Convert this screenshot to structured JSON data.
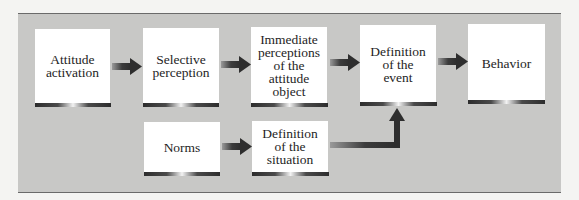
{
  "diagram": {
    "type": "flowchart",
    "nodes": [
      {
        "id": "attitude_activation",
        "label": "Attitude\nactivation"
      },
      {
        "id": "selective_perception",
        "label": "Selective\nperception"
      },
      {
        "id": "immediate_perceptions",
        "label": "Immediate\nperceptions\nof the\nattitude\nobject"
      },
      {
        "id": "definition_event",
        "label": "Definition\nof the\nevent"
      },
      {
        "id": "behavior",
        "label": "Behavior"
      },
      {
        "id": "norms",
        "label": "Norms"
      },
      {
        "id": "definition_situation",
        "label": "Definition\nof the\nsituation"
      }
    ],
    "edges": [
      {
        "from": "attitude_activation",
        "to": "selective_perception"
      },
      {
        "from": "selective_perception",
        "to": "immediate_perceptions"
      },
      {
        "from": "immediate_perceptions",
        "to": "definition_event"
      },
      {
        "from": "definition_event",
        "to": "behavior"
      },
      {
        "from": "norms",
        "to": "definition_situation"
      },
      {
        "from": "definition_situation",
        "to": "definition_event"
      }
    ],
    "colors": {
      "panel": "#c8c8c6",
      "box": "#ffffff",
      "arrow": "#3a3a3a",
      "text": "#1e1e1e"
    }
  }
}
